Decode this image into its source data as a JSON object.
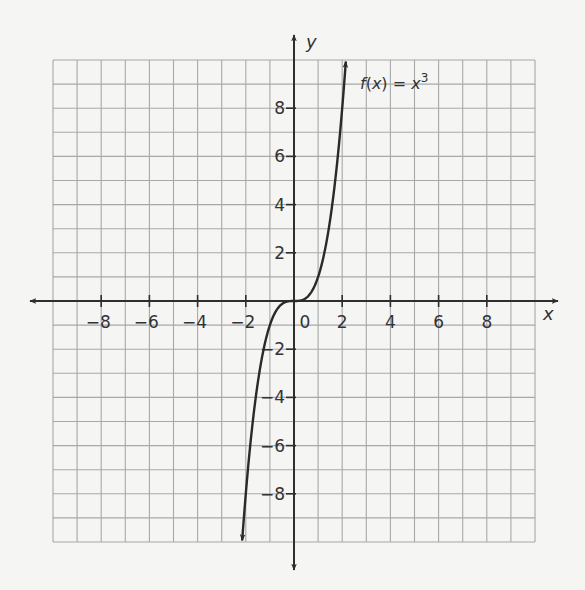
{
  "chart_data": {
    "type": "line",
    "title": "",
    "xlabel": "x",
    "ylabel": "y",
    "xlim": [
      -10,
      10
    ],
    "ylim": [
      -10,
      10
    ],
    "grid": true,
    "x_ticks": [
      -8,
      -6,
      -4,
      -2,
      0,
      2,
      4,
      6,
      8
    ],
    "x_tick_labels": [
      "−8",
      "−6",
      "−4",
      "−2",
      "0",
      "2",
      "4",
      "6",
      "8"
    ],
    "y_ticks": [
      -8,
      -6,
      -4,
      -2,
      2,
      4,
      6,
      8
    ],
    "y_tick_labels": [
      "−8",
      "−6",
      "−4",
      "−2",
      "2",
      "4",
      "6",
      "8"
    ],
    "series": [
      {
        "name": "f(x) = x^3",
        "function": "x^3",
        "x": [
          -2.15,
          -2,
          -1.5,
          -1,
          -0.5,
          0,
          0.5,
          1,
          1.5,
          2,
          2.15
        ],
        "y": [
          -9.94,
          -8,
          -3.375,
          -1,
          -0.125,
          0,
          0.125,
          1,
          3.375,
          8,
          9.94
        ],
        "arrows_at_ends": true
      }
    ],
    "annotations": [
      {
        "text_prefix": "f",
        "text_paren": "(x) = ",
        "text_var": "x",
        "text_exp": "3",
        "position": [
          2.5,
          9.1
        ]
      }
    ]
  },
  "colors": {
    "background": "#f5f5f4",
    "grid": "#a8a8a8",
    "axis": "#2e2e2e",
    "curve": "#2a2a2a"
  }
}
